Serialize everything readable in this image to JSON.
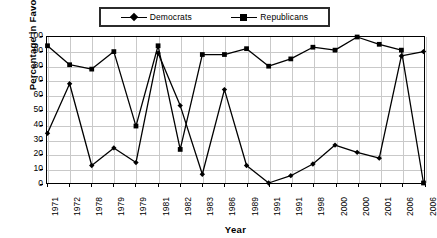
{
  "chart_data": {
    "type": "line",
    "title": "",
    "xlabel": "Year",
    "ylabel": "Percentage in Favor",
    "ylim": [
      0,
      100
    ],
    "ytick_step": 10,
    "yticks": [
      0,
      10,
      20,
      30,
      40,
      50,
      60,
      70,
      80,
      90,
      100
    ],
    "grid": true,
    "legend_position": "top-center",
    "categories": [
      "1971",
      "1972",
      "1978",
      "1979",
      "1979",
      "1981",
      "1982",
      "1983",
      "1986",
      "1989",
      "1991",
      "1991",
      "1998",
      "2000",
      "2000",
      "2001",
      "2006",
      "2006"
    ],
    "series": [
      {
        "name": "Democrats",
        "marker": "diamond",
        "color": "#000000",
        "values": [
          34,
          68,
          12,
          24,
          14,
          89,
          53,
          6,
          64,
          12,
          0,
          5,
          13,
          26,
          21,
          17,
          87,
          90
        ]
      },
      {
        "name": "Republicans",
        "marker": "square",
        "color": "#000000",
        "values": [
          94,
          81,
          78,
          90,
          39,
          94,
          23,
          88,
          88,
          92,
          80,
          85,
          93,
          91,
          100,
          95,
          91,
          0
        ]
      }
    ]
  },
  "legend": {
    "entries": [
      {
        "label": "Democrats"
      },
      {
        "label": "Republicans"
      }
    ]
  },
  "axes": {
    "y_title": "Percentage in Favor",
    "x_title": "Year"
  },
  "colors": {
    "series": "#000000",
    "frame": "#000000",
    "grid": "#c9c9c9",
    "background": "#ffffff"
  }
}
